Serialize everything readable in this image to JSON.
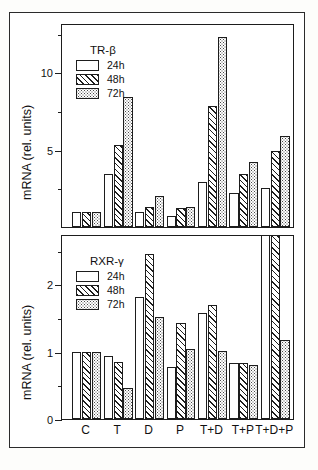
{
  "figure": {
    "panels": [
      {
        "letter": "A",
        "gene": "TR-β",
        "ylabel": "mRNA (rel. units)",
        "ytick_labels": [
          "5",
          "10"
        ]
      },
      {
        "letter": "B",
        "gene": "RXR-γ",
        "ylabel": "mRNA (rel. units)",
        "ytick_labels": [
          "0",
          "1",
          "2"
        ]
      }
    ],
    "legend": {
      "entries": [
        {
          "label": "24h",
          "pattern": "open"
        },
        {
          "label": "48h",
          "pattern": "diagonal-hatch"
        },
        {
          "label": "72h",
          "pattern": "dotted"
        }
      ]
    },
    "xlabels": [
      "C",
      "T",
      "D",
      "P",
      "T+D",
      "T+P",
      "T+D+P"
    ],
    "colors": {
      "ink": "#1d1d1d",
      "paper": "#ffffff",
      "frame": "#2b2b2b"
    }
  },
  "chart_data": [
    {
      "type": "bar",
      "panel": "A",
      "title": "TR-β",
      "xlabel": "",
      "ylabel": "mRNA (rel. units)",
      "ylim": [
        0,
        13.2
      ],
      "yticks": [
        5,
        10
      ],
      "yticks_minor": [
        2.5,
        7.5,
        12.5
      ],
      "grid": false,
      "legend_position": "upper-left",
      "categories": [
        "C",
        "T",
        "D",
        "P",
        "T+D",
        "T+P",
        "T+D+P"
      ],
      "series": [
        {
          "name": "24h",
          "values": [
            1.0,
            3.4,
            1.0,
            0.7,
            2.9,
            2.2,
            2.5
          ]
        },
        {
          "name": "48h",
          "values": [
            1.0,
            5.3,
            1.3,
            1.2,
            7.8,
            3.4,
            4.9
          ]
        },
        {
          "name": "72h",
          "values": [
            1.0,
            8.4,
            2.0,
            1.3,
            12.3,
            4.2,
            5.9
          ]
        }
      ]
    },
    {
      "type": "bar",
      "panel": "B",
      "title": "RXR-γ",
      "xlabel": "",
      "ylabel": "mRNA (rel. units)",
      "ylim": [
        0,
        2.75
      ],
      "yticks": [
        0,
        1,
        2
      ],
      "yticks_minor": [
        0.5,
        1.5,
        2.5
      ],
      "grid": false,
      "legend_position": "upper-left",
      "categories": [
        "C",
        "T",
        "D",
        "P",
        "T+D",
        "T+P",
        "T+D+P"
      ],
      "series": [
        {
          "name": "24h",
          "values": [
            1.0,
            0.93,
            1.82,
            0.78,
            1.58,
            0.83,
            2.75
          ]
        },
        {
          "name": "48h",
          "values": [
            1.0,
            0.85,
            2.46,
            1.43,
            1.7,
            0.84,
            2.75
          ]
        },
        {
          "name": "72h",
          "values": [
            1.0,
            0.46,
            1.52,
            1.04,
            1.01,
            0.8,
            1.18
          ]
        }
      ]
    }
  ]
}
